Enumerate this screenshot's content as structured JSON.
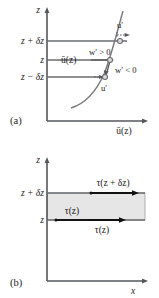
{
  "figure": {
    "caption_a": "(a)",
    "caption_b": "(b)"
  },
  "panel_a": {
    "vertical_axis_label": "z",
    "horizontal_axis_label": "ū(z)",
    "tick_labels": [
      "z + δz",
      "z",
      "z − δz"
    ],
    "curve_label": "ū(z)",
    "annotations": [
      "u′",
      "w′ > 0",
      "w′ < 0",
      "u′"
    ]
  },
  "panel_b": {
    "vertical_axis_label": "z",
    "horizontal_axis_label": "x",
    "tick_labels": [
      "z + δz",
      "z"
    ],
    "stress_top_label": "τ(z + δz)",
    "stress_inner_label": "τ(z)",
    "stress_bottom_label": "τ(z)"
  },
  "colors": {
    "axis": "#55565a",
    "grid": "#6b6c70",
    "curve": "#76777b",
    "shade": "#e6e6e6",
    "ink": "#111111"
  }
}
